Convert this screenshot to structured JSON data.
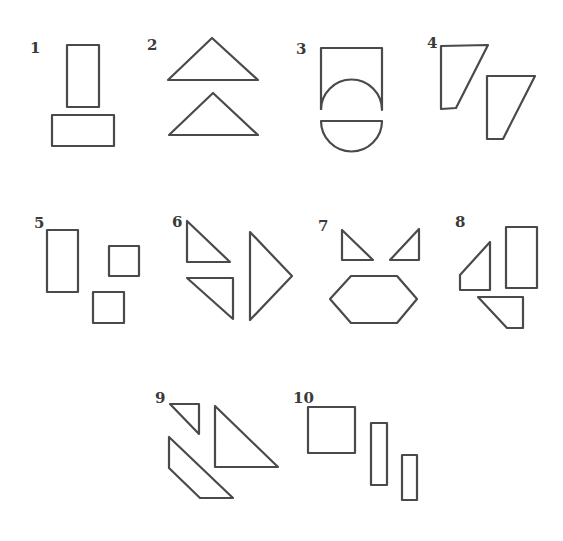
{
  "figures": [
    {
      "number": "1",
      "description": "tall rectangle above wide rectangle"
    },
    {
      "number": "2",
      "description": "two isosceles triangles stacked"
    },
    {
      "number": "3",
      "description": "square with semicircular cutout above a half-disc"
    },
    {
      "number": "4",
      "description": "two right trapezoids"
    },
    {
      "number": "5",
      "description": "rectangle and two squares"
    },
    {
      "number": "6",
      "description": "two small right triangles and one large triangle"
    },
    {
      "number": "7",
      "description": "two small triangles above a hexagon"
    },
    {
      "number": "8",
      "description": "trapezoid, rectangle and quadrilateral"
    },
    {
      "number": "9",
      "description": "small triangle, parallelogram and large right triangle"
    },
    {
      "number": "10",
      "description": "square and two thin rectangles"
    }
  ],
  "colors": {
    "stroke": "#4a4a4a",
    "background": "#ffffff"
  }
}
